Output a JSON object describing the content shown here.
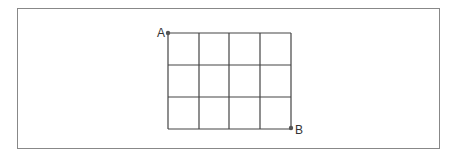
{
  "diagram": {
    "type": "grid",
    "rows": 3,
    "columns": 4,
    "points": [
      {
        "label": "A",
        "position": "top-left corner"
      },
      {
        "label": "B",
        "position": "bottom-right corner"
      }
    ],
    "line_color": "#444444",
    "frame_color": "#888888"
  },
  "labels": {
    "a": "A",
    "b": "B"
  }
}
